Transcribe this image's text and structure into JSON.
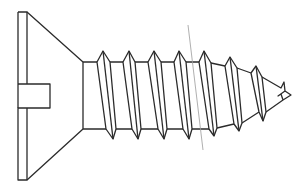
{
  "figure": {
    "title": "Flat head slotted self-tapping screw",
    "stroke_color": "#2b2b2b",
    "guide_line_color": "#9a9a9a",
    "background": "#ffffff"
  }
}
